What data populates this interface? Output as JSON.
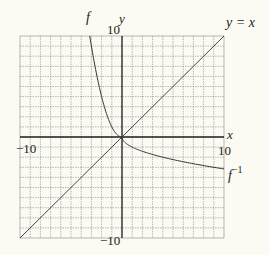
{
  "chart_data": {
    "type": "line",
    "title": "",
    "xlabel": "x",
    "ylabel": "y",
    "xlim": [
      -10,
      10
    ],
    "ylim": [
      -10,
      10
    ],
    "grid": true,
    "grid_step": 1,
    "tick_labels": {
      "x_min": "-10",
      "x_max": "10",
      "y_min": "-10",
      "y_max": "10"
    },
    "series": [
      {
        "name": "f",
        "label": "f",
        "formula": "y = x^2, -sqrt(10) <= x <= 0",
        "x": [
          -3.16,
          -3,
          -2.5,
          -2,
          -1.5,
          -1,
          -0.5,
          0
        ],
        "y": [
          10,
          9,
          6.25,
          4,
          2.25,
          1,
          0.25,
          0
        ]
      },
      {
        "name": "f_inverse",
        "label": "f^-1",
        "formula": "y = -sqrt(x), 0 <= x <= 10",
        "x": [
          0,
          0.25,
          1,
          2.25,
          4,
          6.25,
          9,
          10
        ],
        "y": [
          0,
          -0.5,
          -1,
          -1.5,
          -2,
          -2.5,
          -3,
          -3.16
        ]
      },
      {
        "name": "identity",
        "label": "y = x",
        "x": [
          -10,
          10
        ],
        "y": [
          -10,
          10
        ]
      }
    ],
    "annotations": [
      "f",
      "f^-1",
      "y = x",
      "x",
      "y"
    ],
    "legend": "none (curves labeled inline)"
  },
  "labels": {
    "f": "f",
    "f_inv_base": "f",
    "f_inv_sup": "−1",
    "yx": "y = x",
    "x_axis": "x",
    "y_axis": "y",
    "x_min": "−10",
    "x_max": "10",
    "y_max": "10",
    "y_min": "−10"
  },
  "colors": {
    "grid": "#8a8a8a",
    "axis": "#222222",
    "curve": "#333333",
    "background": "#fbfaf3"
  }
}
